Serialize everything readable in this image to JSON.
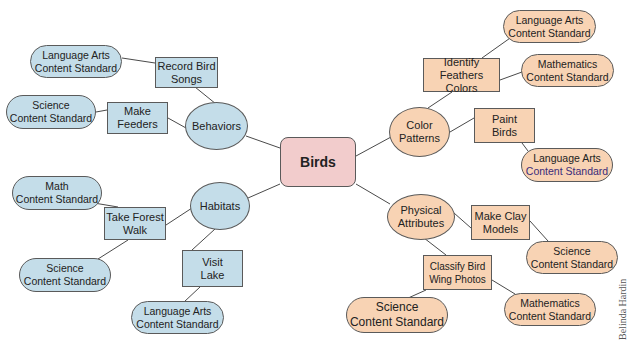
{
  "diagram": {
    "type": "concept-map",
    "colors": {
      "center": "#f2cccc",
      "left_branch": "#c4dde9",
      "right_branch": "#f8d3b4",
      "line": "#4a4a4a"
    },
    "center": {
      "label": "Birds"
    },
    "left": {
      "behaviors": {
        "label": "Behaviors",
        "activities": [
          {
            "label": [
              "Record Bird",
              "Songs"
            ],
            "standards": [
              [
                "Language Arts",
                "Content Standard"
              ]
            ]
          },
          {
            "label": [
              "Make",
              "Feeders"
            ],
            "standards": [
              [
                "Science",
                "Content Standard"
              ]
            ]
          }
        ]
      },
      "habitats": {
        "label": "Habitats",
        "activities": [
          {
            "label": [
              "Take Forest",
              "Walk"
            ],
            "standards": [
              [
                "Math",
                "Content Standard"
              ],
              [
                "Science",
                "Content Standard"
              ]
            ]
          },
          {
            "label": [
              "Visit",
              "Lake"
            ],
            "standards": [
              [
                "Language Arts",
                "Content Standard"
              ]
            ]
          }
        ]
      }
    },
    "right": {
      "color_patterns": {
        "label": [
          "Color",
          "Patterns"
        ],
        "activities": [
          {
            "label": [
              "Identify",
              "Feathers Colors"
            ],
            "standards": [
              [
                "Language Arts",
                "Content Standard"
              ],
              [
                "Mathematics",
                "Content Standard"
              ]
            ]
          },
          {
            "label": [
              "Paint",
              "Birds"
            ],
            "standards": [
              [
                "Language Arts",
                "Content Standard"
              ]
            ]
          }
        ]
      },
      "physical_attributes": {
        "label": [
          "Physical",
          "Attributes"
        ],
        "activities": [
          {
            "label": [
              "Make Clay",
              "Models"
            ],
            "standards": [
              [
                "Science",
                "Content Standard"
              ]
            ]
          },
          {
            "label": [
              "Classify Bird",
              "Wing Photos"
            ],
            "standards": [
              [
                "Science",
                "Content Standard"
              ],
              [
                "Mathematics",
                "Content Standard"
              ]
            ]
          }
        ]
      }
    },
    "credit": "Belinda Hardin"
  }
}
